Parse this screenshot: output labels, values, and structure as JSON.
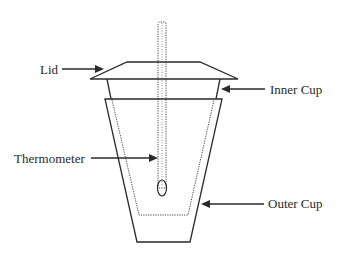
{
  "diagram": {
    "labels": {
      "lid": "Lid",
      "inner_cup": "Inner Cup",
      "thermometer": "Thermometer",
      "outer_cup": "Outer Cup"
    },
    "line_color": "#2a2a2a",
    "background": "#ffffff"
  }
}
